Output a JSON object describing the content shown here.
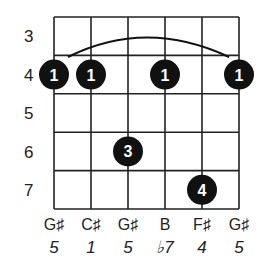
{
  "chord_diagram": {
    "grid": {
      "left": 54,
      "right": 239,
      "top": 17,
      "bottom": 209,
      "string_count": 6,
      "fret_count": 5,
      "line_color": "#222222"
    },
    "fret_numbers": [
      "3",
      "4",
      "5",
      "6",
      "7"
    ],
    "barre": {
      "fret_index": 1,
      "from_string": 0,
      "to_string": 5
    },
    "dots": [
      {
        "string": 0,
        "fret_index": 1,
        "finger": "1"
      },
      {
        "string": 1,
        "fret_index": 1,
        "finger": "1"
      },
      {
        "string": 3,
        "fret_index": 1,
        "finger": "1"
      },
      {
        "string": 5,
        "fret_index": 1,
        "finger": "1"
      },
      {
        "string": 2,
        "fret_index": 3,
        "finger": "3"
      },
      {
        "string": 4,
        "fret_index": 4,
        "finger": "4"
      }
    ],
    "notes": [
      "G♯",
      "C♯",
      "G♯",
      "B",
      "F♯",
      "G♯"
    ],
    "intervals": [
      "5",
      "1",
      "5",
      "♭7",
      "4",
      "5"
    ],
    "dot_color": "#111111",
    "dot_text_color": "#ffffff"
  }
}
